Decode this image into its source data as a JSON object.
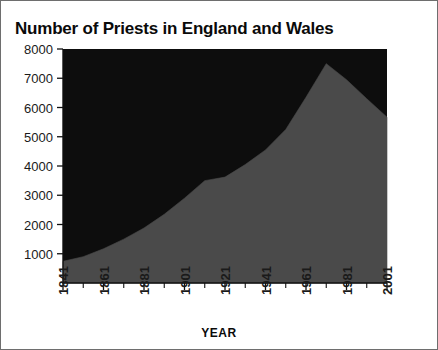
{
  "chart_data": {
    "type": "area",
    "title": "Number of Priests in England and Wales",
    "xlabel": "YEAR",
    "ylabel": "",
    "xlim": [
      1841,
      2001
    ],
    "ylim": [
      0,
      8000
    ],
    "grid": false,
    "legend": "none",
    "series_color": "#4a4a4a",
    "plot_background": "#0d0d0d",
    "y_ticks": [
      8000,
      7000,
      6000,
      5000,
      4000,
      3000,
      2000,
      1000
    ],
    "x_ticks": [
      1841,
      1861,
      1881,
      1901,
      1921,
      1941,
      1961,
      1981,
      2001
    ],
    "x_minor_step": 10,
    "x": [
      1841,
      1851,
      1861,
      1871,
      1881,
      1891,
      1901,
      1911,
      1921,
      1931,
      1941,
      1951,
      1961,
      1971,
      1981,
      1991,
      2001
    ],
    "values": [
      740,
      900,
      1170,
      1500,
      1880,
      2350,
      2900,
      3500,
      3620,
      4050,
      4550,
      5250,
      6350,
      7500,
      6950,
      6300,
      5670
    ],
    "peak": {
      "year": 1971,
      "value": 7500
    },
    "start": {
      "year": 1841,
      "value": 740
    },
    "end": {
      "year": 2001,
      "value": 5670
    }
  },
  "figure": {
    "border_color": "#6e6e6e",
    "background": "#ffffff"
  }
}
